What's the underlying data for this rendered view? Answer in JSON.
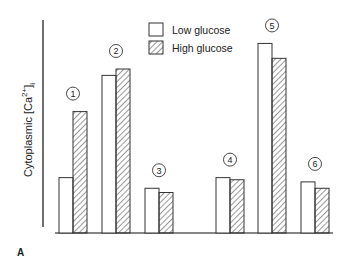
{
  "chart_data": {
    "type": "bar",
    "title": "",
    "panel_label": "A",
    "xlabel": "",
    "ylabel": "Cytoplasmic [Ca2+]i",
    "ylabel_parts": {
      "base": "Cytoplasmic [Ca",
      "sup": "2+",
      "close": "]",
      "sub": "i"
    },
    "y_scale_note": "no tick labels; values are relative heights in arbitrary units (baseline = 0)",
    "ylim": [
      0,
      100
    ],
    "grid": false,
    "legend_position": "top-center",
    "categories": [
      "1",
      "2",
      "3",
      "4",
      "5",
      "6"
    ],
    "category_style": "circled numbers above each bar pair",
    "series": [
      {
        "name": "Low glucose",
        "pattern": "open",
        "values": [
          26,
          74,
          21,
          26,
          89,
          24
        ]
      },
      {
        "name": "High glucose",
        "pattern": "hatched",
        "values": [
          57,
          77,
          19,
          25,
          82,
          21
        ]
      }
    ]
  },
  "legend": {
    "items": [
      {
        "label": "Low glucose"
      },
      {
        "label": "High glucose"
      }
    ]
  }
}
